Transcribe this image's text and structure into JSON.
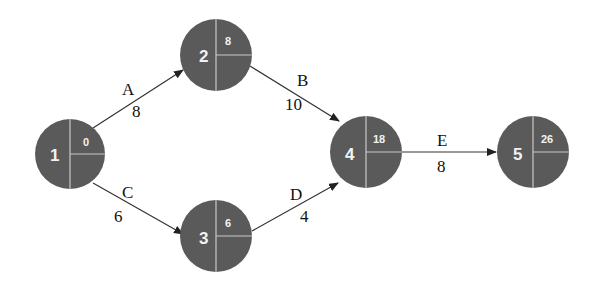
{
  "diagram": {
    "type": "activity-on-arrow network",
    "colors": {
      "node_fill": "#5a5a5a",
      "node_text": "#f2f2f2",
      "divider": "#c8c8c8",
      "edge": "#333333",
      "label": "#111111"
    },
    "nodes": [
      {
        "id": "1",
        "earliest_time": "0",
        "cx": 70,
        "cy": 154
      },
      {
        "id": "2",
        "earliest_time": "8",
        "cx": 216,
        "cy": 55
      },
      {
        "id": "3",
        "earliest_time": "6",
        "cx": 216,
        "cy": 236
      },
      {
        "id": "4",
        "earliest_time": "18",
        "cx": 366,
        "cy": 154
      },
      {
        "id": "5",
        "earliest_time": "26",
        "cx": 533,
        "cy": 154
      }
    ],
    "edges": [
      {
        "activity": "A",
        "duration": "8",
        "from": "1",
        "to": "2"
      },
      {
        "activity": "B",
        "duration": "10",
        "from": "2",
        "to": "4"
      },
      {
        "activity": "C",
        "duration": "6",
        "from": "1",
        "to": "3"
      },
      {
        "activity": "D",
        "duration": "4",
        "from": "3",
        "to": "4"
      },
      {
        "activity": "E",
        "duration": "8",
        "from": "4",
        "to": "5"
      }
    ]
  }
}
